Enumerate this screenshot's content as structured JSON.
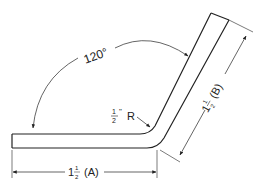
{
  "diagram": {
    "angle_label": "120°",
    "radius_label": {
      "num": "1",
      "den": "2",
      "unit": "\"",
      "suffix": "R"
    },
    "dim_a": {
      "whole": "1",
      "num": "1",
      "den": "2",
      "suffix": "(A)"
    },
    "dim_b": {
      "whole": "1",
      "num": "1",
      "den": "2",
      "suffix": "(B)"
    },
    "colors": {
      "line": "#222222",
      "background": "#ffffff"
    }
  }
}
